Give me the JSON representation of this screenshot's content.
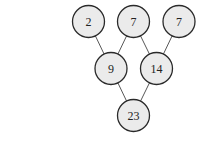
{
  "diagram": {
    "type": "tree",
    "nodes": [
      {
        "id": "n1",
        "label": "2",
        "x": 88.5,
        "y": 21.5
      },
      {
        "id": "n2",
        "label": "7",
        "x": 133.5,
        "y": 21.5
      },
      {
        "id": "n3",
        "label": "7",
        "x": 179,
        "y": 21.5
      },
      {
        "id": "n4",
        "label": "9",
        "x": 111,
        "y": 68.5
      },
      {
        "id": "n5",
        "label": "14",
        "x": 156.5,
        "y": 68.5
      },
      {
        "id": "n6",
        "label": "23",
        "x": 133.5,
        "y": 115.5
      }
    ],
    "edges": [
      [
        "n1",
        "n4"
      ],
      [
        "n2",
        "n4"
      ],
      [
        "n2",
        "n5"
      ],
      [
        "n3",
        "n5"
      ],
      [
        "n4",
        "n6"
      ],
      [
        "n5",
        "n6"
      ]
    ],
    "radius": 16
  }
}
